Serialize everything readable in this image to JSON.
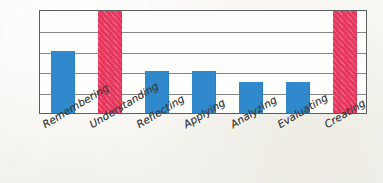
{
  "chart_data": {
    "type": "bar",
    "title": "",
    "subtitle": "",
    "xlabel": "",
    "ylabel": "",
    "categories": [
      "Remembering",
      "Understanding",
      "Reflecting",
      "Applying",
      "Analyzing",
      "Evaluating",
      "Creating"
    ],
    "values": [
      3,
      5,
      2,
      2,
      1.5,
      1.5,
      5
    ],
    "ylim": [
      0,
      5
    ],
    "grid": true,
    "gridline_count": 5,
    "legend": "none",
    "tick_labels_y": [],
    "annotations": [],
    "bar_colors": [
      "#2f89cc",
      "#e8375c",
      "#2f89cc",
      "#2f89cc",
      "#2f89cc",
      "#2f89cc",
      "#e8375c"
    ],
    "series": [
      {
        "name": "level",
        "values": [
          3,
          5,
          2,
          2,
          1.5,
          1.5,
          5
        ]
      }
    ]
  },
  "style": {
    "blue": "#2f89cc",
    "red": "#e8375c",
    "frame_color": "#5d5d5d",
    "grid_color": "#6b6b6b",
    "background": "#f8f7f3",
    "plot_background": "#fdfdfc",
    "label_color": "#3a3a3a"
  }
}
